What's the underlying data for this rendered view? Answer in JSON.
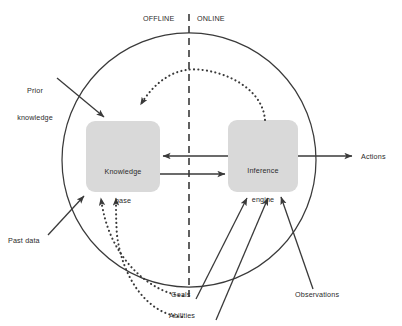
{
  "figure": {
    "type": "block-diagram"
  },
  "zones": {
    "offline_label": "OFFLINE",
    "online_label": "ONLINE",
    "divider": "vertical-dashed-line",
    "boundary": "agent-circle"
  },
  "boxes": {
    "knowledge_base": {
      "line1": "Knowledge",
      "line2": "base",
      "fill": "#d9d9d9"
    },
    "inference_engine": {
      "line1": "Inference",
      "line2": "engine",
      "fill": "#d9d9d9"
    }
  },
  "inputs": {
    "prior_knowledge": {
      "line1": "Prior",
      "line2": "knowledge"
    },
    "past_data": {
      "line1": "Past data"
    },
    "goals": {
      "line1": "Goals"
    },
    "abilities": {
      "line1": "Abilities"
    },
    "observations": {
      "line1": "Observations"
    }
  },
  "outputs": {
    "actions": {
      "line1": "Actions"
    }
  },
  "colors": {
    "stroke": "#3a3a3a",
    "box_fill": "#d9d9d9",
    "text": "#2b2b2b",
    "background": "#ffffff"
  },
  "edges": [
    {
      "from": "inference_engine",
      "to": "knowledge_base",
      "style": "dotted-arc",
      "direction": "right-to-left-over-top"
    },
    {
      "from": "inference_engine",
      "to": "knowledge_base",
      "style": "solid",
      "direction": "right-to-left"
    },
    {
      "from": "knowledge_base",
      "to": "inference_engine",
      "style": "solid",
      "direction": "left-to-right"
    },
    {
      "from": "prior_knowledge",
      "to": "knowledge_base",
      "style": "solid"
    },
    {
      "from": "past_data",
      "to": "knowledge_base",
      "style": "solid"
    },
    {
      "from": "goals",
      "to": "knowledge_base",
      "style": "dotted"
    },
    {
      "from": "abilities",
      "to": "knowledge_base",
      "style": "dotted"
    },
    {
      "from": "goals",
      "to": "inference_engine",
      "style": "solid"
    },
    {
      "from": "abilities",
      "to": "inference_engine",
      "style": "solid"
    },
    {
      "from": "observations",
      "to": "inference_engine",
      "style": "solid"
    },
    {
      "from": "inference_engine",
      "to": "actions",
      "style": "solid"
    }
  ]
}
